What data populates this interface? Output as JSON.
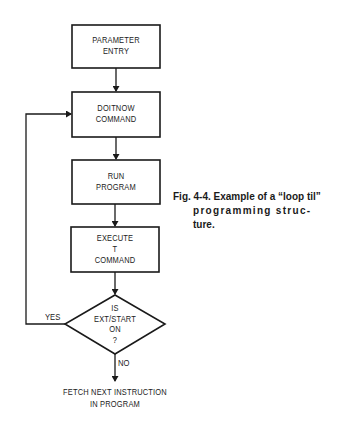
{
  "figure": {
    "nodes": [
      {
        "id": "parameter-entry",
        "type": "process",
        "lines": [
          "PARAMETER",
          "ENTRY"
        ]
      },
      {
        "id": "doitnow-command",
        "type": "process",
        "lines": [
          "DOITNOW",
          "COMMAND"
        ]
      },
      {
        "id": "run-program",
        "type": "process",
        "lines": [
          "RUN",
          "PROGRAM"
        ]
      },
      {
        "id": "execute-t-command",
        "type": "process",
        "lines": [
          "EXECUTE",
          "T",
          "COMMAND"
        ]
      },
      {
        "id": "is-ext-start-on",
        "type": "decision",
        "lines": [
          "IS",
          "EXT/START",
          "ON",
          "?"
        ]
      },
      {
        "id": "fetch-next-instruction",
        "type": "terminal-text",
        "lines": [
          "FETCH NEXT INSTRUCTION",
          "IN PROGRAM"
        ]
      }
    ],
    "edges": [
      {
        "from": "parameter-entry",
        "to": "doitnow-command",
        "label": ""
      },
      {
        "from": "doitnow-command",
        "to": "run-program",
        "label": ""
      },
      {
        "from": "run-program",
        "to": "execute-t-command",
        "label": ""
      },
      {
        "from": "execute-t-command",
        "to": "is-ext-start-on",
        "label": ""
      },
      {
        "from": "is-ext-start-on",
        "to": "doitnow-command",
        "label": "YES"
      },
      {
        "from": "is-ext-start-on",
        "to": "fetch-next-instruction",
        "label": "NO"
      }
    ],
    "labels": {
      "yes": "YES",
      "no": "NO"
    },
    "caption": {
      "line1": "Fig. 4-4. Example of a “loop til”",
      "line2": "programming struc-",
      "line3": "ture."
    }
  }
}
